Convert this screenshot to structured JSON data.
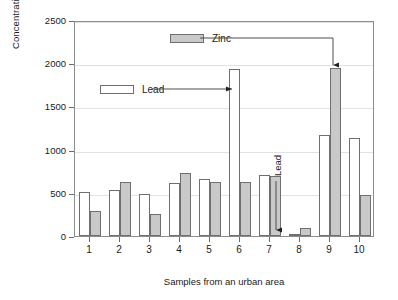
{
  "chart_data": {
    "type": "bar",
    "title": "",
    "xlabel": "Samples from an urban area",
    "ylabel": "Concentration (mg/kg)",
    "categories": [
      "1",
      "2",
      "3",
      "4",
      "5",
      "6",
      "7",
      "8",
      "9",
      "10"
    ],
    "series": [
      {
        "name": "Lead",
        "color": "#ffffff",
        "values": [
          510,
          535,
          490,
          610,
          655,
          1930,
          705,
          20,
          1170,
          1140
        ]
      },
      {
        "name": "Zinc",
        "color": "#c9c9c9",
        "values": [
          290,
          625,
          260,
          730,
          620,
          620,
          700,
          95,
          1950,
          470
        ]
      }
    ],
    "ylim": [
      0,
      2500
    ],
    "yticks": [
      0,
      500,
      1000,
      1500,
      2000,
      2500
    ],
    "ytick_labels": [
      "0",
      "500",
      "1000",
      "1500",
      "2000",
      "2500"
    ],
    "grid": true,
    "legend_position": "inside-top"
  },
  "legend": {
    "zinc": {
      "label": "Zinc",
      "swatch": "gray-filled-swatch"
    },
    "lead": {
      "label": "Lead",
      "swatch": "white-hollow-swatch"
    }
  },
  "annotations": {
    "lead_callout": "Lead",
    "zinc_callout": "Zinc",
    "lead_vertical_callout": "Lead"
  },
  "axes": {
    "y_title": "Concentration (mg/kg)",
    "x_title": "Samples from an urban area"
  }
}
